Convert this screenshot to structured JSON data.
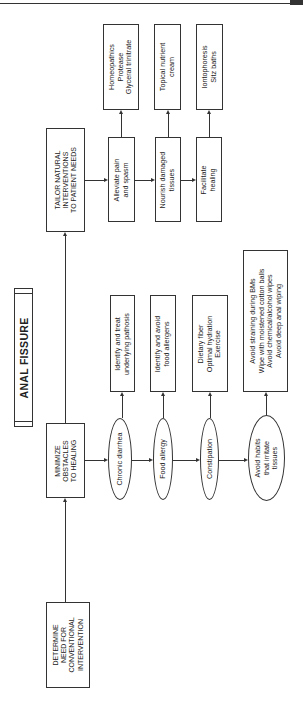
{
  "title": "ANAL FISSURE",
  "nodes": {
    "determine": [
      "DETERMINE",
      "NEED FOR",
      "CONVENTIONAL",
      "INTERVENTION"
    ],
    "minimize": [
      "MINIMIZE",
      "OBSTACLES",
      "TO HEALING"
    ],
    "tailor": [
      "TAILOR NATURAL",
      "INTERVENTIONS",
      "TO PATIENT NEEDS"
    ]
  },
  "obstacles": [
    {
      "label": [
        "Chronic diarrhea"
      ],
      "action": [
        "Identify and treat",
        "underlying pathosis"
      ]
    },
    {
      "label": [
        "Food allergy"
      ],
      "action": [
        "Identify and avoid",
        "food allergens"
      ]
    },
    {
      "label": [
        "Constipation"
      ],
      "action": [
        "Dietary fiber",
        "Optimal hydration",
        "Exercise"
      ]
    },
    {
      "label": [
        "Avoid habits",
        "that irritate",
        "tissues"
      ],
      "action": [
        "Avoid straining during BMs",
        "Wipe with moistened cotton balls",
        "Avoid chemical/alcohol wipes",
        "Avoid deep anal wiping"
      ]
    }
  ],
  "interventions": [
    {
      "goal": [
        "Alleviate pain",
        "and spasm"
      ],
      "treatment": [
        "Homeopathics",
        "Protease",
        "Glyceral trinitrate"
      ]
    },
    {
      "goal": [
        "Nourish damaged",
        "tissues"
      ],
      "treatment": [
        "Topical nutrient",
        "cream"
      ]
    },
    {
      "goal": [
        "Facilitate",
        "healing"
      ],
      "treatment": [
        "Iontophoresis",
        "Sitz baths"
      ]
    }
  ]
}
